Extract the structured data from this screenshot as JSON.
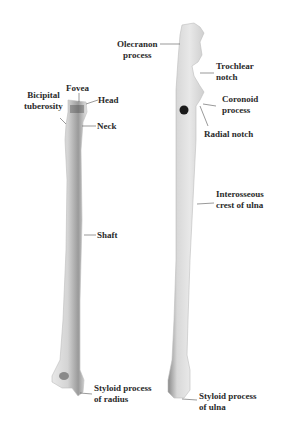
{
  "diagram": {
    "bones": [
      {
        "name": "Radius",
        "side": "left"
      },
      {
        "name": "Ulna",
        "side": "right"
      }
    ],
    "radius_labels": {
      "fovea": "Fovea",
      "bicipital_line1": "Bicipital",
      "bicipital_line2": "tuberosity",
      "head": "Head",
      "neck": "Neck",
      "shaft": "Shaft",
      "styloid_line1": "Styloid process",
      "styloid_line2": "of radius"
    },
    "ulna_labels": {
      "olecranon_line1": "Olecranon",
      "olecranon_line2": "process",
      "trochlear_line1": "Trochlear",
      "trochlear_line2": "notch",
      "coronoid_line1": "Coronoid",
      "coronoid_line2": "process",
      "radial_notch": "Radial notch",
      "interosseous_line1": "Interosseous",
      "interosseous_line2": "crest of ulna",
      "styloid_line1": "Styloid process",
      "styloid_line2": "of ulna"
    },
    "colors": {
      "background": "#ffffff",
      "bone_light": "#f2f2f2",
      "bone_mid": "#c8c8c8",
      "bone_dark": "#6e6e6e",
      "label_text": "#2a2a2a",
      "leader_line": "#555555"
    }
  }
}
